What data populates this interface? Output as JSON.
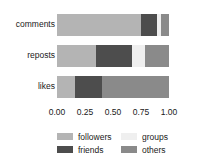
{
  "chart_data": {
    "type": "bar",
    "orientation": "horizontal",
    "stacked": true,
    "normalized": true,
    "title": "",
    "xlabel": "",
    "ylabel": "",
    "categories": [
      "comments",
      "reposts",
      "likes"
    ],
    "xlim": [
      0.0,
      1.0
    ],
    "xticks": [
      0.0,
      0.25,
      0.5,
      0.75,
      1.0
    ],
    "xtick_labels": [
      "0.00",
      "0.25",
      "0.50",
      "0.75",
      "1.00"
    ],
    "grid": false,
    "legend_position": "bottom",
    "series": [
      {
        "name": "followers",
        "color": "#b4b4b4",
        "values": [
          0.75,
          0.35,
          0.16
        ]
      },
      {
        "name": "friends",
        "color": "#4d4d4d",
        "values": [
          0.14,
          0.32,
          0.24
        ]
      },
      {
        "name": "groups",
        "color": "#efefef",
        "values": [
          0.04,
          0.12,
          0.0
        ]
      },
      {
        "name": "others",
        "color": "#8a8a8a",
        "values": [
          0.07,
          0.21,
          0.6
        ]
      }
    ],
    "segments": {
      "comments": [
        {
          "series": "followers",
          "start": 0.0,
          "end": 0.75,
          "value": 0.75
        },
        {
          "series": "friends",
          "start": 0.75,
          "end": 0.89,
          "value": 0.14
        },
        {
          "series": "groups",
          "start": 0.89,
          "end": 0.93,
          "value": 0.04
        },
        {
          "series": "others",
          "start": 0.93,
          "end": 1.0,
          "value": 0.07
        }
      ],
      "reposts": [
        {
          "series": "followers",
          "start": 0.0,
          "end": 0.35,
          "value": 0.35
        },
        {
          "series": "friends",
          "start": 0.35,
          "end": 0.67,
          "value": 0.32
        },
        {
          "series": "groups",
          "start": 0.67,
          "end": 0.79,
          "value": 0.12
        },
        {
          "series": "others",
          "start": 0.79,
          "end": 1.0,
          "value": 0.21
        }
      ],
      "likes": [
        {
          "series": "followers",
          "start": 0.0,
          "end": 0.16,
          "value": 0.16
        },
        {
          "series": "friends",
          "start": 0.16,
          "end": 0.4,
          "value": 0.24
        },
        {
          "series": "others",
          "start": 0.4,
          "end": 1.0,
          "value": 0.6
        }
      ]
    }
  },
  "legend": {
    "entries": [
      {
        "label": "followers",
        "color": "#b4b4b4"
      },
      {
        "label": "groups",
        "color": "#efefef"
      },
      {
        "label": "friends",
        "color": "#4d4d4d"
      },
      {
        "label": "others",
        "color": "#8a8a8a"
      }
    ]
  },
  "colors": {
    "background": "#ffffff",
    "text": "#1a1a1a",
    "followers": "#b4b4b4",
    "friends": "#4d4d4d",
    "groups": "#efefef",
    "others": "#8a8a8a"
  }
}
